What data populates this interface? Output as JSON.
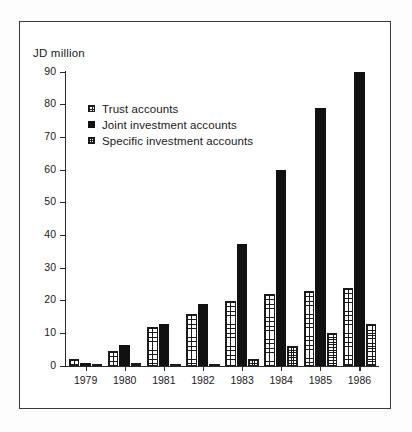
{
  "chart_data": {
    "type": "bar",
    "title": "",
    "subtitle": "",
    "xlabel": "",
    "ylabel": "JD million",
    "ylim": [
      0,
      90
    ],
    "ytick_step": 10,
    "yticks": [
      0,
      10,
      20,
      30,
      40,
      50,
      60,
      70,
      80,
      90
    ],
    "grid": false,
    "legend_position": "upper-left-inside",
    "categories": [
      "1979",
      "1980",
      "1981",
      "1982",
      "1983",
      "1984",
      "1985",
      "1986"
    ],
    "series": [
      {
        "name": "Trust accounts",
        "pattern": "light-grid",
        "color": "#1b1b1b",
        "values": [
          2,
          4.5,
          12,
          16,
          20,
          22,
          23,
          24
        ]
      },
      {
        "name": "Joint investment accounts",
        "pattern": "solid",
        "color": "#111111",
        "values": [
          1,
          6.5,
          13,
          19,
          37.5,
          60,
          79,
          90
        ]
      },
      {
        "name": "Specific investment accounts",
        "pattern": "dense-grid",
        "color": "#1b1b1b",
        "values": [
          0.5,
          1,
          0.5,
          0.5,
          2,
          6,
          10,
          13
        ]
      }
    ]
  },
  "axis": {
    "y_title": "JD million"
  },
  "legend": {
    "items": [
      {
        "label": "Trust accounts",
        "swatch": "light-grid-swatch"
      },
      {
        "label": "Joint investment accounts",
        "swatch": "solid-black-swatch"
      },
      {
        "label": "Specific investment accounts",
        "swatch": "dense-grid-swatch"
      }
    ]
  },
  "colors": {
    "ink": "#1a1a1a",
    "axis": "#2b2b2b",
    "frame": "#3a3a3a",
    "background": "#ffffff",
    "bar_solid": "#111111"
  }
}
